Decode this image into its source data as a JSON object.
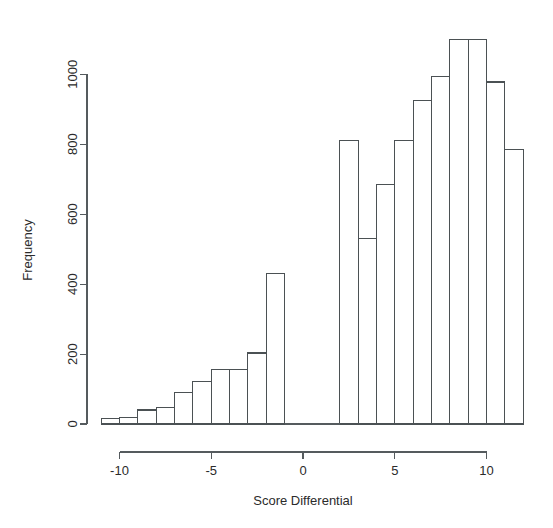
{
  "chart_data": {
    "type": "bar",
    "title": "",
    "subtitle": "",
    "xlabel": "Score Differential",
    "ylabel": "Frequency",
    "xlim": [
      -11.8,
      12.2
    ],
    "ylim": [
      0,
      1120
    ],
    "grid": false,
    "legend": null,
    "x_ticks": [
      "-10",
      "-5",
      "0",
      "5",
      "10"
    ],
    "x_tick_values": [
      -10,
      -5,
      0,
      5,
      10
    ],
    "y_ticks": [
      "0",
      "200",
      "400",
      "600",
      "800",
      "1000"
    ],
    "y_tick_values": [
      0,
      200,
      400,
      600,
      800,
      1000
    ],
    "bin_width": 1,
    "bin_edges": [
      -11,
      -10,
      -9,
      -8,
      -7,
      -6,
      -5,
      -4,
      -3,
      -2,
      -1,
      0,
      1,
      2,
      3,
      4,
      5,
      6,
      7,
      8,
      9,
      10,
      11,
      12
    ],
    "categories": [
      "-11 to -10",
      "-10 to -9",
      "-9 to -8",
      "-8 to -7",
      "-7 to -6",
      "-6 to -5",
      "-5 to -4",
      "-4 to -3",
      "-3 to -2",
      "-2 to -1",
      "-1 to 0",
      "0 to 1",
      "1 to 2",
      "2 to 3",
      "3 to 4",
      "4 to 5",
      "5 to 6",
      "6 to 7",
      "7 to 8",
      "8 to 9",
      "9 to 10",
      "10 to 11",
      "11 to 12"
    ],
    "values": [
      15,
      18,
      40,
      48,
      90,
      122,
      155,
      157,
      203,
      430,
      0,
      0,
      0,
      810,
      530,
      685,
      812,
      925,
      995,
      1100,
      1100,
      978,
      785
    ]
  },
  "axes": {
    "y_axis_title": "Frequency",
    "x_axis_title": "Score Differential"
  }
}
